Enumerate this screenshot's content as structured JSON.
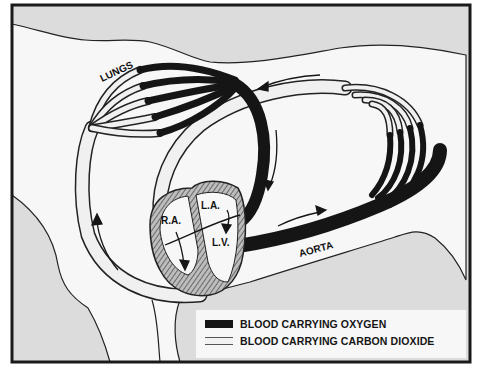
{
  "diagram": {
    "labels": {
      "lungs": "LUNGS",
      "right_atrium": "R.A.",
      "left_atrium": "L.A.",
      "left_ventricle": "L.V.",
      "aorta": "AORTA"
    },
    "colors": {
      "oxygen_blood": "#151515",
      "co2_blood": "#f2f2f2",
      "background_shade": "#dcdcdc",
      "body_fill": "#f7f7f7",
      "heart_muscle": "#9a9a9a",
      "frame": "#1a1a1a"
    }
  },
  "legend": {
    "items": [
      {
        "label": "BLOOD CARRYING OXYGEN",
        "swatch": "dark"
      },
      {
        "label": "BLOOD CARRYING CARBON DIOXIDE",
        "swatch": "light"
      }
    ]
  }
}
